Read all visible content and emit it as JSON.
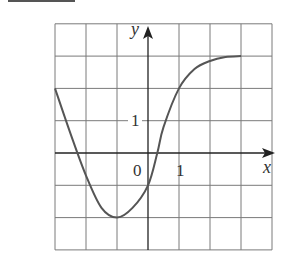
{
  "chart_data": {
    "type": "line",
    "title": "",
    "xlabel": "x",
    "ylabel": "y",
    "xlim": [
      -3,
      4
    ],
    "ylim": [
      -3,
      4
    ],
    "grid": true,
    "tick_labels": {
      "origin": "0",
      "x_tick": "1",
      "y_tick": "1"
    },
    "series": [
      {
        "name": "f(x)",
        "x": [
          -3,
          -2.5,
          -2,
          -1.5,
          -1,
          -0.5,
          0,
          0.3,
          0.5,
          1,
          1.5,
          2,
          2.5,
          3
        ],
        "values": [
          2,
          0.6,
          -0.7,
          -1.7,
          -2,
          -1.7,
          -1,
          0,
          0.8,
          2,
          2.6,
          2.85,
          2.97,
          3
        ]
      }
    ]
  },
  "labels": {
    "x_axis": "x",
    "y_axis": "y",
    "origin": "0",
    "x_one": "1",
    "y_one": "1"
  },
  "colors": {
    "grid": "#7a7a7a",
    "axis": "#222222",
    "curve": "#555555"
  }
}
